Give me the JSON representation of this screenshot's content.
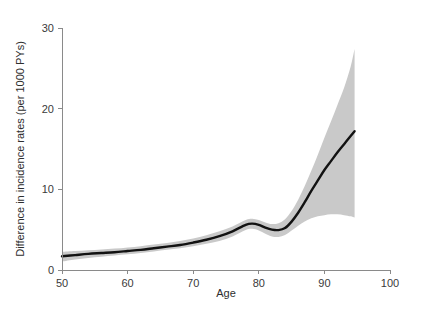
{
  "chart_data": {
    "type": "line",
    "title": "",
    "subtitle": "",
    "xlabel": "Age",
    "ylabel": "Difference in incidence rates (per 1000 PYs)",
    "xlim": [
      50,
      100
    ],
    "ylim": [
      0,
      30
    ],
    "xticks": [
      50,
      60,
      70,
      80,
      90,
      100
    ],
    "yticks": [
      0,
      10,
      20,
      30
    ],
    "xtick_labels": [
      "50",
      "60",
      "70",
      "80",
      "90",
      "100"
    ],
    "ytick_labels": [
      "0",
      "10",
      "20",
      "30"
    ],
    "grid": false,
    "legend": null,
    "annotations": [],
    "colors": {
      "line": "#121212",
      "band": "#c9c9c9",
      "axis": "#8a8a8a",
      "background": "#ffffff",
      "figure_background": "#fdfdfd"
    },
    "series": [
      {
        "name": "Difference in incidence rates",
        "style": "solid-line",
        "x": [
          50,
          52,
          54,
          56,
          58,
          60,
          62,
          64,
          66,
          68,
          70,
          72,
          74,
          76,
          78,
          79,
          80,
          81,
          82,
          83,
          84,
          85,
          86,
          87,
          88,
          89,
          90,
          91,
          92,
          93,
          94,
          94.6
        ],
        "values": [
          1.7,
          1.85,
          2.0,
          2.1,
          2.2,
          2.35,
          2.5,
          2.7,
          2.9,
          3.1,
          3.4,
          3.75,
          4.2,
          4.8,
          5.6,
          5.75,
          5.6,
          5.25,
          5.0,
          4.95,
          5.2,
          6.0,
          7.1,
          8.4,
          9.8,
          11.1,
          12.4,
          13.5,
          14.6,
          15.6,
          16.6,
          17.2
        ]
      },
      {
        "name": "Upper 95% confidence limit",
        "style": "shaded-band-upper",
        "x": [
          50,
          52,
          54,
          56,
          58,
          60,
          62,
          64,
          66,
          68,
          70,
          72,
          74,
          76,
          78,
          79,
          80,
          81,
          82,
          83,
          84,
          85,
          86,
          87,
          88,
          89,
          90,
          91,
          92,
          93,
          94,
          94.6
        ],
        "values": [
          2.25,
          2.35,
          2.45,
          2.55,
          2.65,
          2.8,
          2.95,
          3.15,
          3.35,
          3.6,
          3.9,
          4.3,
          4.8,
          5.4,
          6.2,
          6.35,
          6.2,
          5.9,
          5.7,
          5.8,
          6.3,
          7.3,
          8.7,
          10.4,
          12.3,
          14.3,
          16.4,
          18.4,
          20.5,
          22.6,
          25.2,
          27.4
        ]
      },
      {
        "name": "Lower 95% confidence limit",
        "style": "shaded-band-lower",
        "x": [
          50,
          52,
          54,
          56,
          58,
          60,
          62,
          64,
          66,
          68,
          70,
          72,
          74,
          76,
          78,
          79,
          80,
          81,
          82,
          83,
          84,
          85,
          86,
          87,
          88,
          89,
          90,
          91,
          92,
          93,
          94,
          94.6
        ],
        "values": [
          1.05,
          1.3,
          1.5,
          1.65,
          1.8,
          1.95,
          2.1,
          2.3,
          2.5,
          2.7,
          2.95,
          3.25,
          3.6,
          4.15,
          4.95,
          5.1,
          4.9,
          4.5,
          4.15,
          4.1,
          4.35,
          4.9,
          5.5,
          6.0,
          6.4,
          6.65,
          6.8,
          6.9,
          6.9,
          6.8,
          6.65,
          6.5
        ]
      }
    ]
  }
}
